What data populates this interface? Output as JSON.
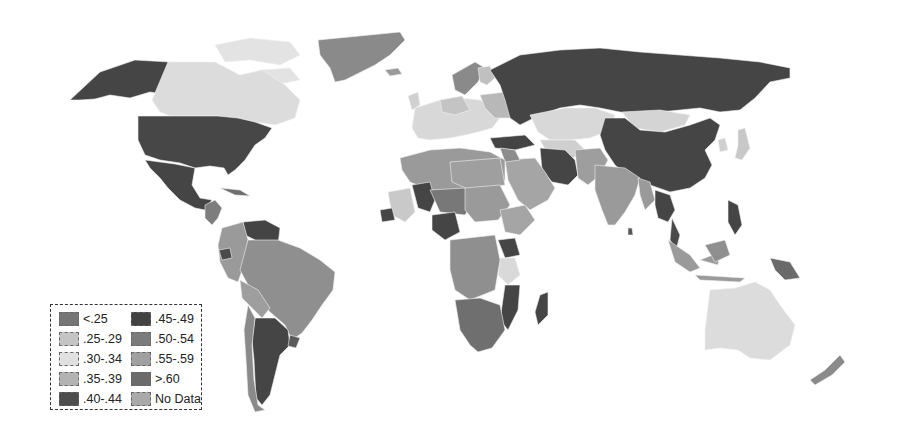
{
  "map": {
    "type": "choropleth-world",
    "palette": {
      "lt25": "#757575",
      "25_29": "#bdbdbd",
      "30_34": "#dedede",
      "35_39": "#b0b0b0",
      "40_44": "#4a4a4a",
      "45_49": "#404040",
      "50_54": "#7a7a7a",
      "55_59": "#9c9c9c",
      "gt60": "#6a6a6a",
      "nodata": "#a8a8a8"
    }
  },
  "legend": {
    "items": [
      {
        "label": "<.25",
        "color": "#757575"
      },
      {
        "label": ".25-.29",
        "color": "#c4c4c4"
      },
      {
        "label": ".30-.34",
        "color": "#e0e0e0"
      },
      {
        "label": ".35-.39",
        "color": "#b3b3b3"
      },
      {
        "label": ".40-.44",
        "color": "#4d4d4d"
      },
      {
        "label": ".45-.49",
        "color": "#424242"
      },
      {
        "label": ".50-.54",
        "color": "#7b7b7b"
      },
      {
        "label": ".55-.59",
        "color": "#a0a0a0"
      },
      {
        "label": ">.60",
        "color": "#6b6b6b"
      },
      {
        "label": "No Data",
        "color": "#a9a9a9"
      }
    ]
  }
}
